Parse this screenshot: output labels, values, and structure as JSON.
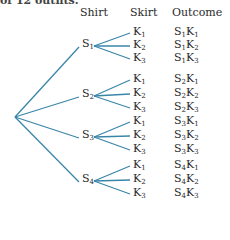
{
  "caption_fragment": "of 12 outfits.",
  "headers": {
    "shirt": "Shirt",
    "skirt": "Skirt",
    "outcome": "Outcome"
  },
  "line_color": "#3a86a8",
  "tree": {
    "root": "",
    "shirts": [
      {
        "label": "S",
        "sub": "1",
        "skirts": [
          {
            "label": "K",
            "sub": "1"
          },
          {
            "label": "K",
            "sub": "2"
          },
          {
            "label": "K",
            "sub": "3"
          }
        ],
        "outcomes": [
          "S1K1",
          "S1K2",
          "S1K3"
        ]
      },
      {
        "label": "S",
        "sub": "2",
        "skirts": [
          {
            "label": "K",
            "sub": "1"
          },
          {
            "label": "K",
            "sub": "2"
          },
          {
            "label": "K",
            "sub": "3"
          }
        ],
        "outcomes": [
          "S2K1",
          "S2K2",
          "S2K3"
        ]
      },
      {
        "label": "S",
        "sub": "3",
        "skirts": [
          {
            "label": "K",
            "sub": "1"
          },
          {
            "label": "K",
            "sub": "2"
          },
          {
            "label": "K",
            "sub": "3"
          }
        ],
        "outcomes": [
          "S3K1",
          "S3K2",
          "S3K3"
        ]
      },
      {
        "label": "S",
        "sub": "4",
        "skirts": [
          {
            "label": "K",
            "sub": "1"
          },
          {
            "label": "K",
            "sub": "2"
          },
          {
            "label": "K",
            "sub": "3"
          }
        ],
        "outcomes": [
          "S4K1",
          "S4K2",
          "S4K3"
        ]
      }
    ]
  },
  "layout": {
    "root": [
      15,
      117
    ],
    "shirt_x": 82,
    "shirt_y": [
      45,
      95,
      136,
      180
    ],
    "skirt_y": [
      [
        33,
        46,
        59
      ],
      [
        80,
        94,
        108
      ],
      [
        122,
        136,
        150
      ],
      [
        166,
        180,
        194
      ]
    ]
  }
}
